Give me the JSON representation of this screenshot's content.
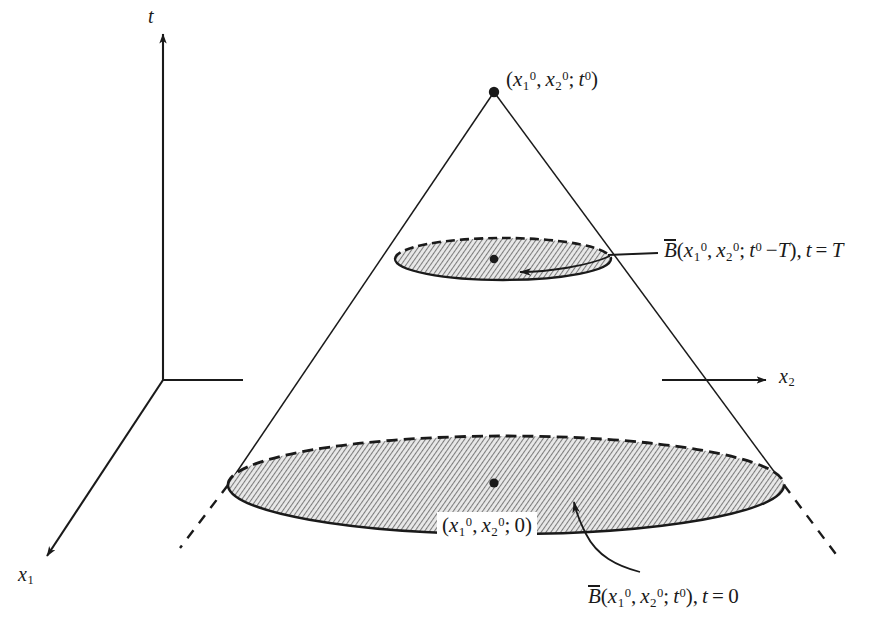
{
  "figure": {
    "type": "3d-cone-diagram",
    "background_color": "#ffffff",
    "line_color": "#1a1a1a",
    "hatch_fill_color": "#9a9a9a"
  },
  "axes": [
    {
      "name": "t-axis",
      "label_text": "t",
      "label_italic": true,
      "direction": "up"
    },
    {
      "name": "x2-axis",
      "label_text": "x",
      "label_sub": "2",
      "label_italic": true,
      "direction": "right"
    },
    {
      "name": "x1-axis",
      "label_text": "x",
      "label_sub": "1",
      "label_italic": true,
      "direction": "down-left"
    }
  ],
  "apex": {
    "name": "cone-apex",
    "label_parts": {
      "open": "(",
      "x1": "x",
      "x1_sub": "1",
      "x1_sup": "0",
      "comma1": ",",
      "x2": "x",
      "x2_sub": "2",
      "x2_sup": "0",
      "semi": ";",
      "t": "t",
      "t_sup": "0",
      "close": ")"
    },
    "label_plain": "(x1^0, x2^0; t^0)"
  },
  "upper_disk": {
    "name": "upper-cross-section",
    "annotation": {
      "B": "B",
      "overbar": true,
      "open": "(",
      "x1": "x",
      "x1_sub": "1",
      "x1_sup": "0",
      "comma1": ",",
      "x2": "x",
      "x2_sub": "2",
      "x2_sup": "0",
      "semi": ";",
      "t": "t",
      "t_sup": "0",
      "minus": "−",
      "T": "T",
      "close": ")",
      "comma2": ",",
      "t_eq": "t",
      "equals": "=",
      "value": "T"
    },
    "annotation_plain": "B̅(x1^0, x2^0; t^0 − T), t = T"
  },
  "lower_disk": {
    "name": "lower-cross-section",
    "center_label": {
      "open": "(",
      "x1": "x",
      "x1_sub": "1",
      "x1_sup": "0",
      "comma1": ",",
      "x2": "x",
      "x2_sub": "2",
      "x2_sup": "0",
      "semi": ";",
      "zero": "0",
      "close": ")"
    },
    "center_label_plain": "(x1^0, x2^0; 0)",
    "annotation": {
      "B": "B",
      "overbar": true,
      "open": "(",
      "x1": "x",
      "x1_sub": "1",
      "x1_sup": "0",
      "comma1": ",",
      "x2": "x",
      "x2_sub": "2",
      "x2_sup": "0",
      "semi": ";",
      "t": "t",
      "t_sup": "0",
      "close": ")",
      "comma2": ",",
      "t_eq": "t",
      "equals": "=",
      "value": "0"
    },
    "annotation_plain": "B̅(x1^0, x2^0; t^0), t = 0"
  }
}
